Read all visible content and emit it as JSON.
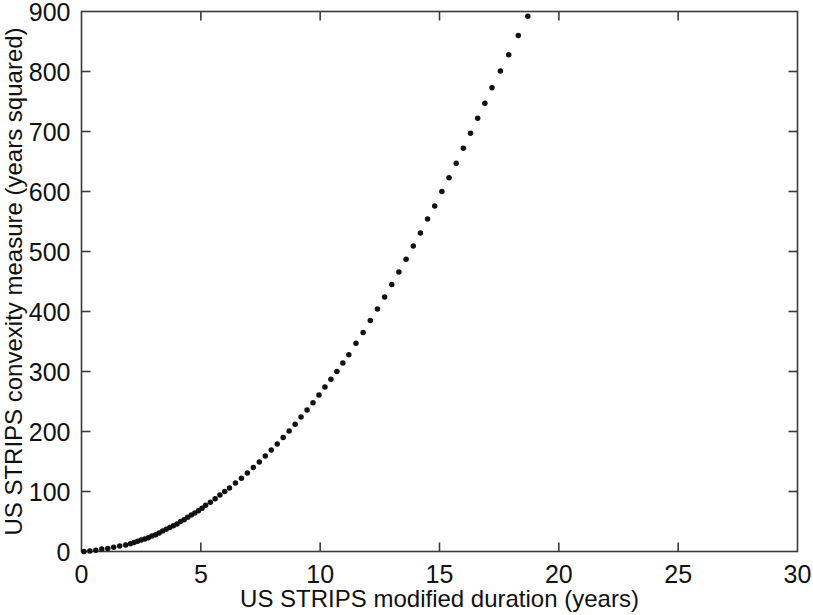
{
  "figure": {
    "background_color": "#ffffff",
    "frame_color": "#3b3b3b",
    "marker_color": "#111111"
  },
  "chart_data": {
    "type": "scatter",
    "title": "",
    "subtitle": "",
    "xlabel": "US STRIPS modified duration (years)",
    "ylabel": "US STRIPS convexity measure (years squared)",
    "xlim": [
      0,
      30
    ],
    "ylim": [
      0,
      900
    ],
    "xticks": [
      0,
      5,
      10,
      15,
      20,
      25,
      30
    ],
    "yticks": [
      0,
      100,
      200,
      300,
      400,
      500,
      600,
      700,
      800,
      900
    ],
    "xtick_labels": [
      "0",
      "5",
      "10",
      "15",
      "20",
      "25",
      "30"
    ],
    "ytick_labels": [
      "0",
      "100",
      "200",
      "300",
      "400",
      "500",
      "600",
      "700",
      "800",
      "900"
    ],
    "grid": false,
    "legend": null,
    "legend_position": "none",
    "marker": "filled-circle",
    "marker_size_px": 5.5,
    "annotations": [],
    "series": [
      {
        "name": "US STRIPS",
        "x": [
          0.1,
          0.35,
          0.6,
          0.85,
          1.1,
          1.35,
          1.6,
          1.85,
          2.05,
          2.2,
          2.35,
          2.5,
          2.65,
          2.8,
          2.95,
          3.1,
          3.25,
          3.4,
          3.55,
          3.7,
          3.85,
          4.0,
          4.15,
          4.3,
          4.45,
          4.6,
          4.75,
          4.9,
          5.05,
          5.2,
          5.4,
          5.6,
          5.8,
          6.0,
          6.2,
          6.45,
          6.7,
          6.95,
          7.2,
          7.45,
          7.7,
          7.95,
          8.2,
          8.45,
          8.7,
          8.95,
          9.2,
          9.45,
          9.7,
          9.95,
          10.2,
          10.45,
          10.7,
          10.95,
          11.2,
          11.5,
          11.8,
          12.1,
          12.4,
          12.7,
          13.0,
          13.3,
          13.6,
          13.9,
          14.2,
          14.5,
          14.8,
          15.1,
          15.4,
          15.7,
          16.0,
          16.3,
          16.6,
          16.9,
          17.2,
          17.55,
          17.9,
          18.3,
          18.7,
          19.1,
          19.5,
          19.9,
          20.35,
          20.8,
          21.3,
          21.8,
          22.3,
          22.85,
          23.4,
          24.0,
          24.6,
          25.2,
          25.85,
          26.6,
          27.3,
          27.8,
          28.1
        ],
        "y": [
          0,
          1,
          2,
          4,
          5,
          7,
          9,
          11,
          13,
          15,
          17,
          19,
          21,
          23,
          26,
          28,
          31,
          34,
          37,
          40,
          43,
          46,
          50,
          53,
          57,
          61,
          64,
          68,
          72,
          77,
          82,
          88,
          94,
          100,
          106,
          114,
          122,
          131,
          140,
          149,
          159,
          169,
          179,
          190,
          201,
          212,
          224,
          236,
          248,
          261,
          274,
          287,
          300,
          314,
          328,
          347,
          365,
          385,
          404,
          424,
          445,
          466,
          487,
          509,
          531,
          554,
          576,
          600,
          623,
          647,
          672,
          697,
          722,
          747,
          773,
          801,
          828,
          860,
          892,
          924,
          957,
          989,
          1025,
          1061,
          1101,
          1141,
          1181,
          1225,
          1270,
          1318,
          1366,
          1414,
          1466,
          1526,
          1581,
          1620,
          1644
        ],
        "relationship_note": "convexity grows approximately as duration x (duration + 1)"
      }
    ]
  }
}
